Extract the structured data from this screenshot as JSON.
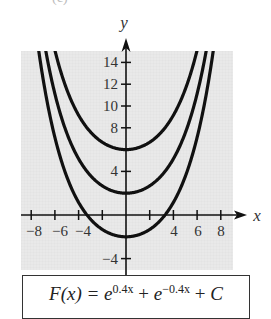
{
  "part_label": "(c)",
  "chart_data": {
    "type": "line",
    "title": "",
    "xlabel": "x",
    "ylabel": "y",
    "function": "F(x) = e^{0.4x} + e^{-0.4x} + C",
    "series": [
      {
        "name": "C = 4",
        "C": 4,
        "minimum": [
          0,
          6
        ]
      },
      {
        "name": "C = 0",
        "C": 0,
        "minimum": [
          0,
          2
        ]
      },
      {
        "name": "C = -4",
        "C": -4,
        "minimum": [
          0,
          -2
        ]
      }
    ],
    "x_ticks": [
      -8,
      -6,
      -4,
      -2,
      2,
      4,
      6,
      8
    ],
    "x_tick_labels": [
      {
        "value": -8,
        "label": "−8"
      },
      {
        "value": -6,
        "label": "−6"
      },
      {
        "value": -4,
        "label": "−4"
      },
      {
        "value": 4,
        "label": "4"
      },
      {
        "value": 6,
        "label": "6"
      },
      {
        "value": 8,
        "label": "8"
      }
    ],
    "y_ticks": [
      -4,
      4,
      8,
      10,
      12,
      14
    ],
    "y_tick_labels": [
      {
        "value": 14,
        "label": "14"
      },
      {
        "value": 12,
        "label": "12"
      },
      {
        "value": 10,
        "label": "10"
      },
      {
        "value": 8,
        "label": "8"
      },
      {
        "value": 4,
        "label": "4"
      },
      {
        "value": -4,
        "label": "−4"
      }
    ],
    "xlim": [
      -9,
      9
    ],
    "ylim": [
      -5,
      15
    ],
    "grid": true,
    "legend": "none",
    "colors": {
      "panel": "#e8e8e8",
      "grid": "#d9d9d9",
      "curve": "#111111",
      "axis": "#111111"
    }
  },
  "formula": {
    "lhs": "F(x) = ",
    "base1": "e",
    "exp1": "0.4x",
    "plus1": " + ",
    "base2": "e",
    "exp2": "−0.4x",
    "plus2": " + ",
    "const": "C"
  }
}
